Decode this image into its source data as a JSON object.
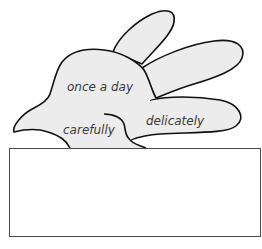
{
  "diagram": {
    "type": "hand-word-web",
    "shape_fill": "#ececec",
    "outline_color": "#111111",
    "words": [
      {
        "id": "palm",
        "text": "once a day"
      },
      {
        "id": "thumb",
        "text": "carefully"
      },
      {
        "id": "finger",
        "text": "delicately"
      }
    ],
    "answer_box": {
      "value": "",
      "border_color": "#4a4a4a"
    }
  }
}
